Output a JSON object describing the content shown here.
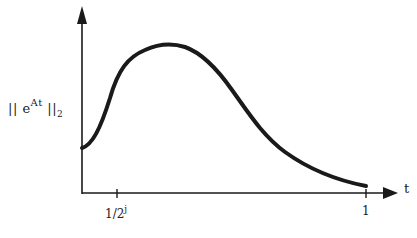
{
  "diagram": {
    "y_label": {
      "prefix": "|| e",
      "superscript": "At",
      "suffix": " ||",
      "subscript": "2"
    },
    "x_label": "t",
    "ticks": [
      {
        "base": "1/2",
        "superscript": "j",
        "x": 117
      },
      {
        "label": "1",
        "x": 366
      }
    ],
    "curve_description": "Norm of matrix exponential: starts at moderate value at t=0, rises to a hump near t=1/2^j, then decays toward zero by t=1",
    "colors": {
      "stroke": "#1a1a1a",
      "background": "#ffffff"
    }
  }
}
